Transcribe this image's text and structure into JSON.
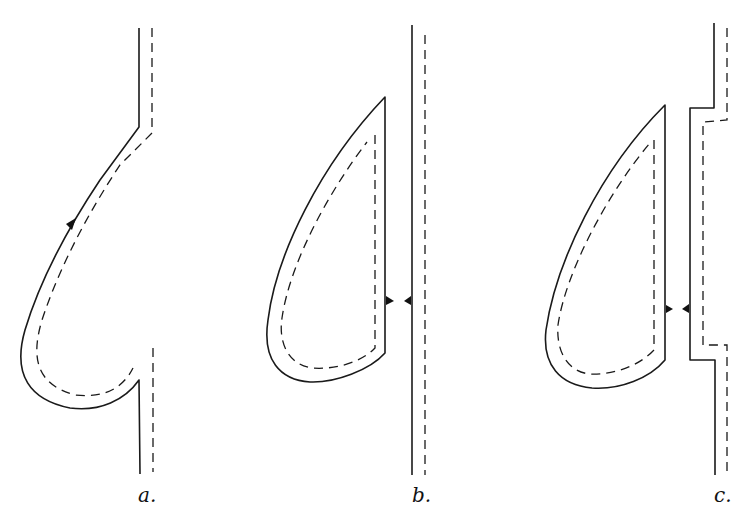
{
  "panels": [
    {
      "id": "a",
      "label": "a.",
      "description": "Droplet attached to wall, wall bulges around drop"
    },
    {
      "id": "b",
      "label": "b.",
      "description": "Droplet beside straight wall"
    },
    {
      "id": "c",
      "label": "c.",
      "description": "Droplet beside wall with recessed step"
    }
  ],
  "colors": {
    "line": "#1a1a1a",
    "background": "#ffffff"
  }
}
